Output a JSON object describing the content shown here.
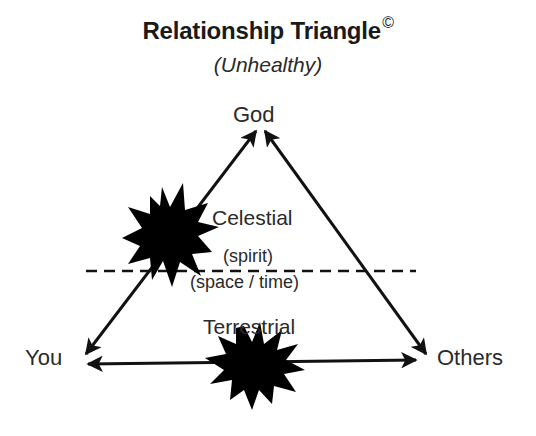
{
  "title": {
    "main": "Relationship Triangle",
    "copyright_mark": "©",
    "subtitle": "(Unhealthy)"
  },
  "nodes": {
    "top": "God",
    "left": "You",
    "right": "Others"
  },
  "regions": {
    "upper_label": "Celestial",
    "upper_sublabel": "(spirit)",
    "lower_sublabel": "(space / time)",
    "lower_label": "Terrestrial"
  },
  "edges": [
    {
      "from": "You",
      "to": "God",
      "style": "double-arrow",
      "broken_by": "starburst"
    },
    {
      "from": "God",
      "to": "Others",
      "style": "double-arrow"
    },
    {
      "from": "You",
      "to": "Others",
      "style": "double-arrow",
      "broken_by": "starburst"
    }
  ],
  "divider": {
    "style": "dashed",
    "separates": [
      "Celestial (spirit)",
      "(space / time)"
    ]
  },
  "colors": {
    "ink": "#111111",
    "text": "#2a2a2a",
    "background": "#ffffff"
  }
}
